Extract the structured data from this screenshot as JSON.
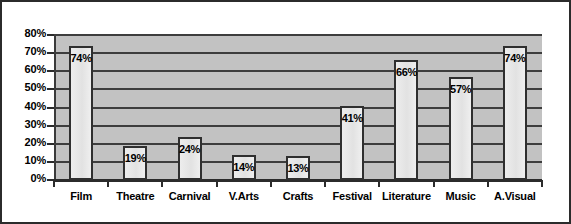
{
  "chart_data": {
    "type": "bar",
    "title": "",
    "xlabel": "",
    "ylabel": "",
    "categories": [
      "Film",
      "Theatre",
      "Carnival",
      "V.Arts",
      "Crafts",
      "Festival",
      "Literature",
      "Music",
      "A.Visual"
    ],
    "values": [
      74,
      19,
      24,
      14,
      13,
      41,
      66,
      57,
      74
    ],
    "data_labels": [
      "74%",
      "19%",
      "24%",
      "14%",
      "13%",
      "41%",
      "66%",
      "57%",
      "74%"
    ],
    "ylim": [
      0,
      80
    ],
    "ytick_values": [
      0,
      10,
      20,
      30,
      40,
      50,
      60,
      70,
      80
    ],
    "ytick_labels": [
      "0%",
      "10%",
      "20%",
      "30%",
      "40%",
      "50%",
      "60%",
      "70%",
      "80%"
    ],
    "grid": true,
    "legend": null,
    "legend_position": "none",
    "colors": {
      "bar_fill": "#e8e8e8",
      "bar_border": "#2f2f2f",
      "plot_background": "#c2c2c2",
      "gridline": "#3d3d3d",
      "axis": "#2b2b2b",
      "text": "#000000",
      "page_background": "#ffffff",
      "frame_border": "#2b2b2b"
    }
  }
}
